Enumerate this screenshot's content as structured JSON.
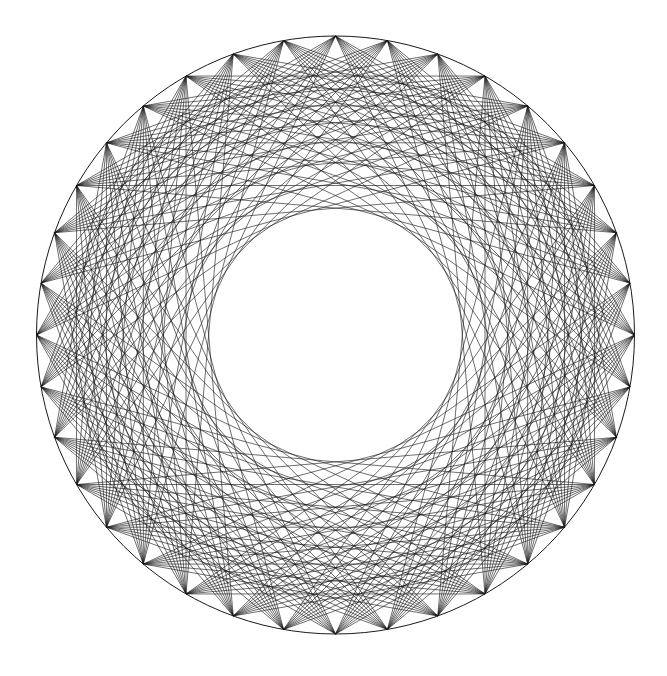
{
  "diagram": {
    "type": "string-art-chord-pattern",
    "background": "#ffffff",
    "stroke_color": "#1a1a1a",
    "center": [
      335.5,
      335
    ],
    "radius": 299,
    "vertex_count": 36,
    "start_angle_deg": -90,
    "chord_skips": [
      6,
      7,
      8,
      9,
      10,
      11,
      12,
      13
    ],
    "draw_rim": true,
    "inner_empty_radius": 122
  }
}
